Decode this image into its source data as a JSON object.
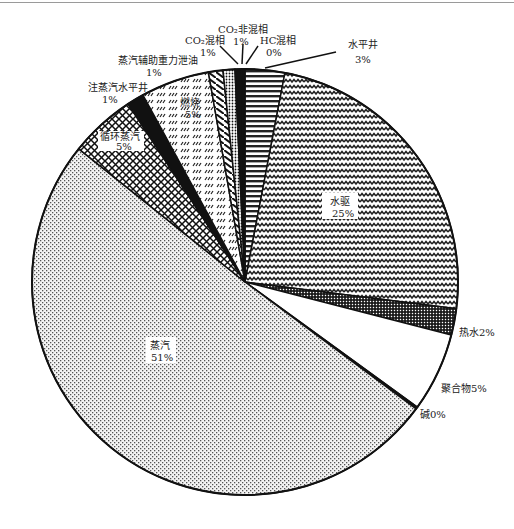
{
  "chart_data": {
    "type": "pie",
    "title": "",
    "start_angle": "12 o'clock",
    "direction": "clockwise",
    "legend": "none",
    "slices": [
      {
        "key": "horizontal_well",
        "name": "水平井",
        "pct_label": "3%",
        "value": 3,
        "pattern": "hlines"
      },
      {
        "key": "waterflood",
        "name": "水驱",
        "pct_label": "25%",
        "value": 24,
        "pattern": "zigzag"
      },
      {
        "key": "hot_water",
        "name": "热水",
        "pct_label": "2%",
        "value": 2,
        "pattern": "grid"
      },
      {
        "key": "polymer",
        "name": "聚合物",
        "pct_label": "5%",
        "value": 6,
        "pattern": "none"
      },
      {
        "key": "alkali",
        "name": "碱",
        "pct_label": "0%",
        "value": 0.15,
        "pattern": "black"
      },
      {
        "key": "steam",
        "name": "蒸汽",
        "pct_label": "51%",
        "value": 50.6,
        "pattern": "stipple"
      },
      {
        "key": "cyclic_steam",
        "name": "循环蒸汽",
        "pct_label": "5%",
        "value": 5,
        "pattern": "crosshatch"
      },
      {
        "key": "steam_horizontal_well",
        "name": "注蒸汽水平井",
        "pct_label": "1%",
        "value": 1.3,
        "pattern": "black"
      },
      {
        "key": "combustion",
        "name": "燃烧",
        "pct_label": "5%",
        "value": 5.2,
        "pattern": "dashes"
      },
      {
        "key": "sagd",
        "name": "蒸汽辅助重力泄油",
        "pct_label": "1%",
        "value": 1.1,
        "pattern": "chevron"
      },
      {
        "key": "co2_miscible",
        "name": "CO₂混相",
        "pct_label": "1%",
        "value": 0.9,
        "pattern": "dots"
      },
      {
        "key": "co2_immiscible",
        "name": "CO₂非混相",
        "pct_label": "1%",
        "value": 0.5,
        "pattern": "black"
      },
      {
        "key": "hc_miscible",
        "name": "HC混相",
        "pct_label": "0%",
        "value": 0.25,
        "pattern": "black"
      }
    ],
    "labels": {
      "horizontal_well": {
        "line1": "水平井",
        "line2": "3%"
      },
      "waterflood": {
        "line1": "水驱",
        "line2": "25%"
      },
      "hot_water": {
        "line1": "热水2%"
      },
      "polymer": {
        "line1": "聚合物5%"
      },
      "alkali": {
        "line1": "碱0%"
      },
      "steam": {
        "line1": "蒸汽",
        "line2": "51%"
      },
      "cyclic_steam": {
        "line1": "循环蒸汽",
        "line2": "5%"
      },
      "steam_horizontal_well": {
        "line1": "注蒸汽水平井",
        "line2": "1%"
      },
      "combustion": {
        "line1": "燃烧",
        "line2": "5%"
      },
      "sagd": {
        "line1": "蒸汽辅助重力泄油",
        "line2": "1%"
      },
      "co2_miscible": {
        "line1": "CO₂混相",
        "line2": "1%"
      },
      "co2_immiscible": {
        "line1": "CO₂非混相",
        "line2": "1%"
      },
      "hc_miscible": {
        "line1": "HC混相",
        "line2": "0%"
      }
    }
  }
}
